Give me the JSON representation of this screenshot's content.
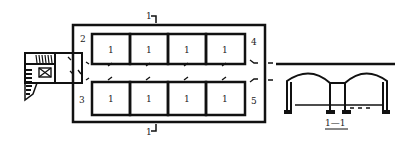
{
  "plan": {
    "section_marker_top": "1",
    "section_marker_bottom": "1",
    "rooms_top": [
      {
        "label": "1"
      },
      {
        "label": "1"
      },
      {
        "label": "1"
      },
      {
        "label": "1"
      }
    ],
    "rooms_bottom": [
      {
        "label": "1"
      },
      {
        "label": "1"
      },
      {
        "label": "1"
      },
      {
        "label": "1"
      }
    ],
    "corner_labels": {
      "top_left": "2",
      "bottom_left": "3",
      "top_right": "4",
      "bottom_right": "5"
    }
  },
  "section": {
    "title": "1—1"
  },
  "colors": {
    "line": "#111111",
    "background": "#ffffff"
  }
}
